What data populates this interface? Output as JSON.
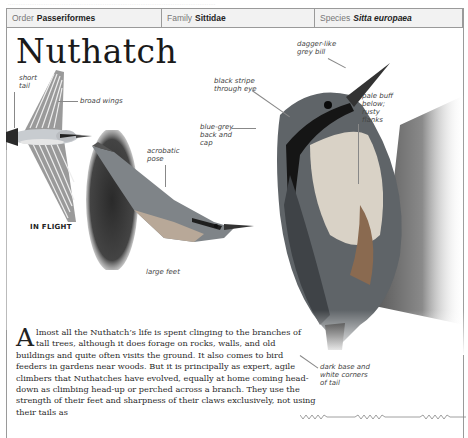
{
  "page": {
    "ghost_text": "....................................................................................................................",
    "header": {
      "order_label": "Order",
      "order_value": "Passeriformes",
      "family_label": "Family",
      "family_value": "Sittidae",
      "species_label": "Species",
      "species_value": "Sitta europaea"
    },
    "title": "Nuthatch",
    "flight_labels": {
      "short_tail": "short\ntail",
      "broad_wings": "broad wings",
      "caption": "IN FLIGHT"
    },
    "acrobatic_labels": {
      "acrobatic_pose": "acrobatic\npose",
      "large_feet": "large feet"
    },
    "main_labels": {
      "dagger_bill": "dagger-like\ngrey bill",
      "black_stripe": "black stripe\nthrough eye",
      "blue_grey": "blue-grey\nback and\ncap",
      "pale_buff": "pale buff\nbelow;\nrusty\nflanks",
      "dark_base": "dark base and\nwhite corners\nof tail"
    },
    "body": {
      "drop_cap": "A",
      "text": "lmost all the Nuthatch’s life is spent clinging to the branches of tall trees, although it does forage on rocks, walls, and old buildings and quite often visits the ground. It also comes to bird feeders in gardens near woods. But it is principally as expert, agile climbers that Nuthatches have evolved, equally at home coming head-down as climbing head-up or perched across a branch. They use the strength of their feet and sharpness of their claws exclusively, not using their tails as"
    },
    "song_graphic": "song-waveform"
  }
}
